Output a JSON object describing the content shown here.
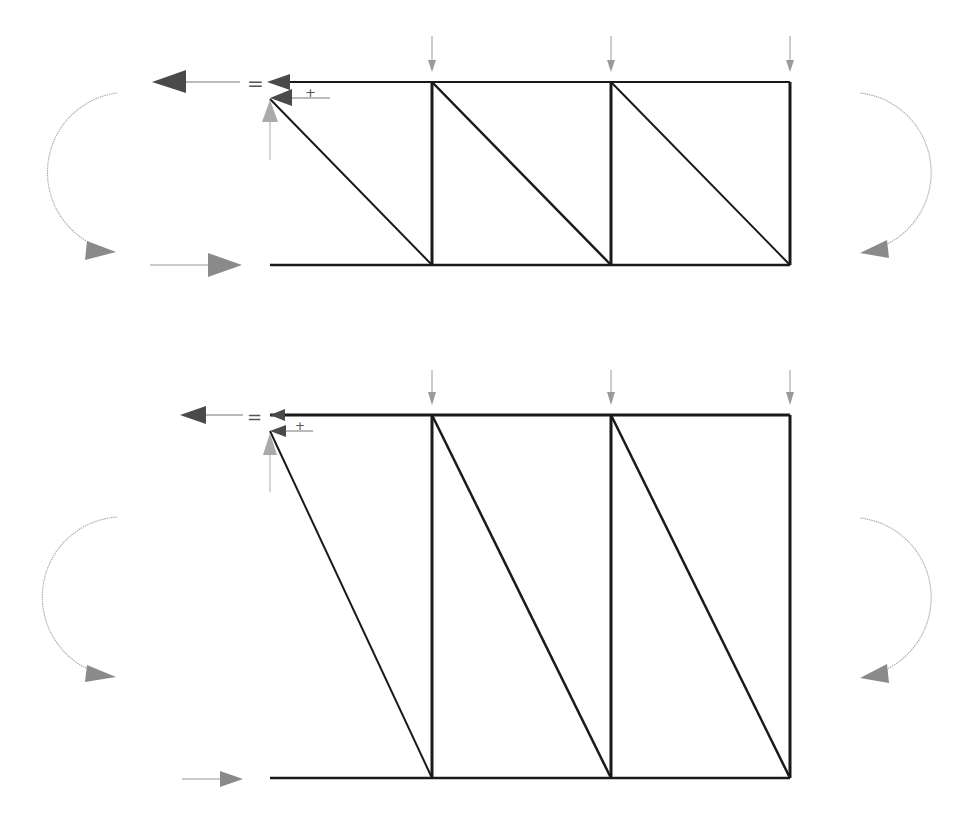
{
  "diagram": {
    "title": "",
    "colors": {
      "member": "#1a1a1a",
      "load_arrow": "#9a9a9a",
      "force_arrow_dark": "#4a4a4a",
      "moment_arrow": "#a0a0a0",
      "moment_head": "#8a8a8a",
      "background": "#ffffff"
    },
    "symbols": {
      "equals": "=",
      "plus": "+"
    },
    "trusses": [
      {
        "id": "truss-short",
        "top_y": 82,
        "bottom_y": 265,
        "nodes_x": [
          270,
          432,
          611,
          790
        ],
        "diagonals": "top-left to bottom-right in each panel",
        "loads": [
          "downward load",
          "downward load",
          "downward load"
        ],
        "left_moment": "clockwise",
        "right_moment": "clockwise"
      },
      {
        "id": "truss-tall",
        "top_y": 415,
        "bottom_y": 778,
        "nodes_x": [
          270,
          432,
          611,
          790
        ],
        "diagonals": "top-left to bottom-right in each panel",
        "loads": [
          "downward load",
          "downward load",
          "downward load"
        ],
        "left_moment": "clockwise",
        "right_moment": "clockwise"
      }
    ]
  }
}
